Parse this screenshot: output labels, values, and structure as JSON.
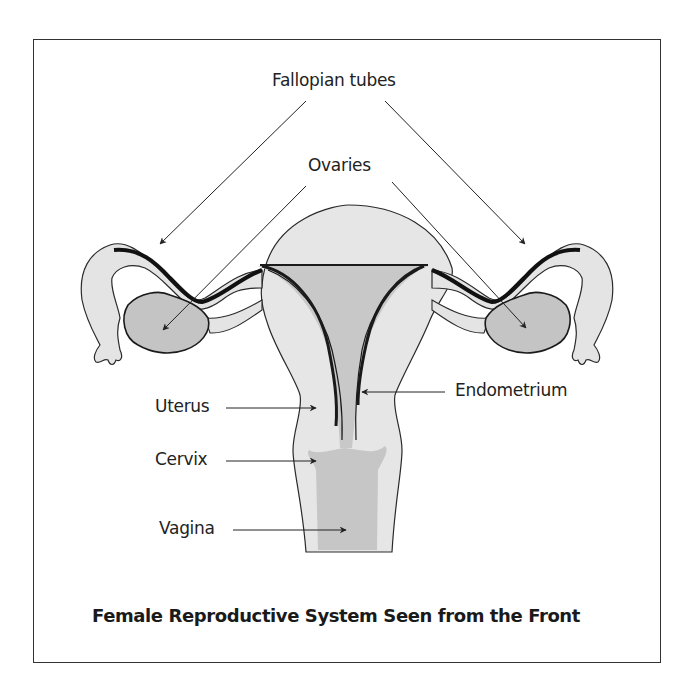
{
  "figure": {
    "title": "Female Reproductive System Seen from the Front",
    "labels": {
      "fallopian_tubes": "Fallopian tubes",
      "ovaries": "Ovaries",
      "uterus": "Uterus",
      "endometrium": "Endometrium",
      "cervix": "Cervix",
      "vagina": "Vagina"
    },
    "colors": {
      "tissue_light": "#e4e4e4",
      "tissue_dark": "#c4c4c4",
      "outline": "#222222",
      "background": "#ffffff"
    }
  }
}
